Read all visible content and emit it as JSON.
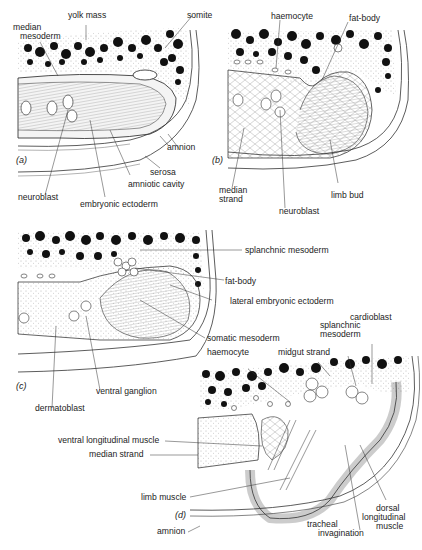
{
  "figure": {
    "panels": [
      {
        "id": "a",
        "tag": "(a)",
        "labels": [
          {
            "key": "yolk_mass",
            "text": "yolk mass"
          },
          {
            "key": "somite",
            "text": "somite"
          },
          {
            "key": "median_mesoderm_1",
            "text": "median"
          },
          {
            "key": "median_mesoderm_2",
            "text": "mesoderm"
          },
          {
            "key": "amnion",
            "text": "amnion"
          },
          {
            "key": "serosa",
            "text": "serosa"
          },
          {
            "key": "amniotic_cavity",
            "text": "amniotic cavity"
          },
          {
            "key": "neuroblast",
            "text": "neuroblast"
          },
          {
            "key": "embryonic_ectoderm",
            "text": "embryonic ectoderm"
          }
        ]
      },
      {
        "id": "b",
        "tag": "(b)",
        "labels": [
          {
            "key": "haemocyte",
            "text": "haemocyte"
          },
          {
            "key": "fat_body",
            "text": "fat-body"
          },
          {
            "key": "median_strand_1",
            "text": "median"
          },
          {
            "key": "median_strand_2",
            "text": "strand"
          },
          {
            "key": "limb_bud",
            "text": "limb bud"
          },
          {
            "key": "neuroblast",
            "text": "neuroblast"
          }
        ]
      },
      {
        "id": "c",
        "tag": "(c)",
        "labels": [
          {
            "key": "splanchnic_mesoderm",
            "text": "splanchnic mesoderm"
          },
          {
            "key": "fat_body",
            "text": "fat-body"
          },
          {
            "key": "lateral_embryonic_ectoderm",
            "text": "lateral embryonic ectoderm"
          },
          {
            "key": "somatic_mesoderm",
            "text": "somatic mesoderm"
          },
          {
            "key": "ventral_ganglion",
            "text": "ventral ganglion"
          },
          {
            "key": "dermatoblast",
            "text": "dermatoblast"
          }
        ]
      },
      {
        "id": "d",
        "tag": "(d)",
        "labels": [
          {
            "key": "cardioblast",
            "text": "cardioblast"
          },
          {
            "key": "splanchnic_mesoderm_1",
            "text": "splanchnic"
          },
          {
            "key": "splanchnic_mesoderm_2",
            "text": "mesoderm"
          },
          {
            "key": "haemocyte",
            "text": "haemocyte"
          },
          {
            "key": "midgut_strand",
            "text": "midgut strand"
          },
          {
            "key": "ventral_longitudinal_muscle",
            "text": "ventral longitudinal muscle"
          },
          {
            "key": "median_strand",
            "text": "median strand"
          },
          {
            "key": "limb_muscle",
            "text": "limb muscle"
          },
          {
            "key": "amnion",
            "text": "amnion"
          },
          {
            "key": "tracheal_invagination_1",
            "text": "tracheal"
          },
          {
            "key": "tracheal_invagination_2",
            "text": "invagination"
          },
          {
            "key": "dorsal_longitudinal_muscle_1",
            "text": "dorsal"
          },
          {
            "key": "dorsal_longitudinal_muscle_2",
            "text": "longitudinal"
          },
          {
            "key": "dorsal_longitudinal_muscle_3",
            "text": "muscle"
          }
        ]
      }
    ]
  },
  "colors": {
    "ink": "#1a1a1a",
    "paper": "#ffffff",
    "stipple": "#777777",
    "tissue_fill": "#f2f2f2",
    "ectoderm_fill": "#e4e4e4"
  }
}
